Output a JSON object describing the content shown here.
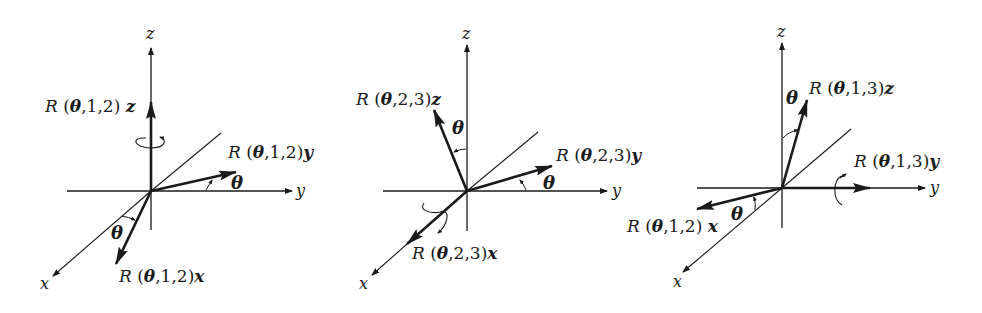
{
  "figure": {
    "panels": [
      {
        "id": "rotation-1-2",
        "axes": {
          "x": "x",
          "y": "y",
          "z": "z"
        },
        "vectors": {
          "z": {
            "R": "R",
            "open": " (",
            "theta": "θ",
            "args": ",1,2)",
            "sym": "z"
          },
          "y": {
            "R": "R",
            "open": " (",
            "theta": "θ",
            "args": ",1,2)",
            "sym": "y"
          },
          "x": {
            "R": "R",
            "open": " (",
            "theta": "θ",
            "args": ",1,2)",
            "sym": "x"
          }
        },
        "angle_labels": [
          "θ",
          "θ"
        ],
        "rotation_axis": "z"
      },
      {
        "id": "rotation-2-3",
        "axes": {
          "x": "x",
          "y": "y",
          "z": "z"
        },
        "vectors": {
          "z": {
            "R": "R",
            "open": " (",
            "theta": "θ",
            "args": ",2,3)",
            "sym": "z"
          },
          "y": {
            "R": "R",
            "open": " (",
            "theta": "θ",
            "args": ",2,3)",
            "sym": "y"
          },
          "x": {
            "R": "R",
            "open": " (",
            "theta": "θ",
            "args": ",2,3)",
            "sym": "x"
          }
        },
        "angle_labels": [
          "θ",
          "θ"
        ],
        "rotation_axis": "x"
      },
      {
        "id": "rotation-1-3",
        "axes": {
          "x": "x",
          "y": "y",
          "z": "z"
        },
        "vectors": {
          "z": {
            "R": "R",
            "open": "  (",
            "theta": "θ",
            "args": ",1,3)",
            "sym": "z"
          },
          "y": {
            "R": "R",
            "open": " (",
            "theta": "θ",
            "args": ",1,3)",
            "sym": "y"
          },
          "x": {
            "R": "R",
            "open": " (",
            "theta": "θ",
            "args": ",1,2)",
            "sym": "x"
          }
        },
        "angle_labels": [
          "θ",
          "θ"
        ],
        "rotation_axis": "y"
      }
    ],
    "colors": {
      "ink": "#1a1a1a",
      "background": "#ffffff"
    }
  }
}
